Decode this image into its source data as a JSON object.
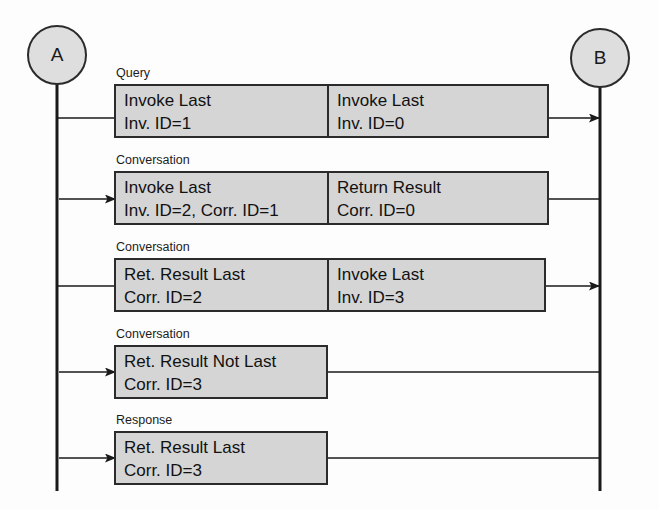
{
  "diagram": {
    "type": "uml-sequence-diagram",
    "colors": {
      "background": "#fdfdfd",
      "box_fill": "#d5d5d5",
      "box_stroke": "#2b2b2b",
      "lifeline": "#1a1a1a",
      "actor_fill": "#dedede",
      "text": "#111111"
    },
    "actors": [
      {
        "id": "A",
        "label": "A",
        "cx": 57,
        "cy": 55,
        "r": 29,
        "lifeline_top": 84,
        "lifeline_bottom": 491
      },
      {
        "id": "B",
        "label": "B",
        "cx": 600,
        "cy": 58,
        "r": 29,
        "lifeline_top": 87,
        "lifeline_bottom": 491
      }
    ],
    "messages": [
      {
        "stage_label": "Query",
        "direction": "right",
        "split": true,
        "left_cell": {
          "line1": "Invoke Last",
          "line2": "Inv. ID=1"
        },
        "right_cell": {
          "line1": "Invoke Last",
          "line2": "Inv. ID=0"
        },
        "box": {
          "x": 115,
          "y": 85,
          "w": 433,
          "h": 52,
          "divider_x": 328
        },
        "connector_y": 118
      },
      {
        "stage_label": "Conversation",
        "direction": "left",
        "split": true,
        "left_cell": {
          "line1": "Invoke Last",
          "line2": "Inv. ID=2, Corr. ID=1"
        },
        "right_cell": {
          "line1": "Return Result",
          "line2": "Corr. ID=0"
        },
        "box": {
          "x": 115,
          "y": 172,
          "w": 433,
          "h": 52,
          "divider_x": 328
        },
        "connector_y": 199
      },
      {
        "stage_label": "Conversation",
        "direction": "right",
        "split": true,
        "left_cell": {
          "line1": "Ret. Result Last",
          "line2": "Corr. ID=2"
        },
        "right_cell": {
          "line1": "Invoke Last",
          "line2": "Inv. ID=3"
        },
        "box": {
          "x": 115,
          "y": 259,
          "w": 430,
          "h": 52,
          "divider_x": 328
        },
        "connector_y": 286
      },
      {
        "stage_label": "Conversation",
        "direction": "left",
        "split": false,
        "left_cell": {
          "line1": "Ret. Result Not Last",
          "line2": "Corr. ID=3"
        },
        "right_cell": null,
        "box": {
          "x": 115,
          "y": 346,
          "w": 212,
          "h": 52,
          "divider_x": null
        },
        "connector_y": 372
      },
      {
        "stage_label": "Response",
        "direction": "left",
        "split": false,
        "left_cell": {
          "line1": "Ret. Result Last",
          "line2": "Corr. ID=3"
        },
        "right_cell": null,
        "box": {
          "x": 115,
          "y": 432,
          "w": 212,
          "h": 52,
          "divider_x": null
        },
        "connector_y": 458
      }
    ]
  }
}
